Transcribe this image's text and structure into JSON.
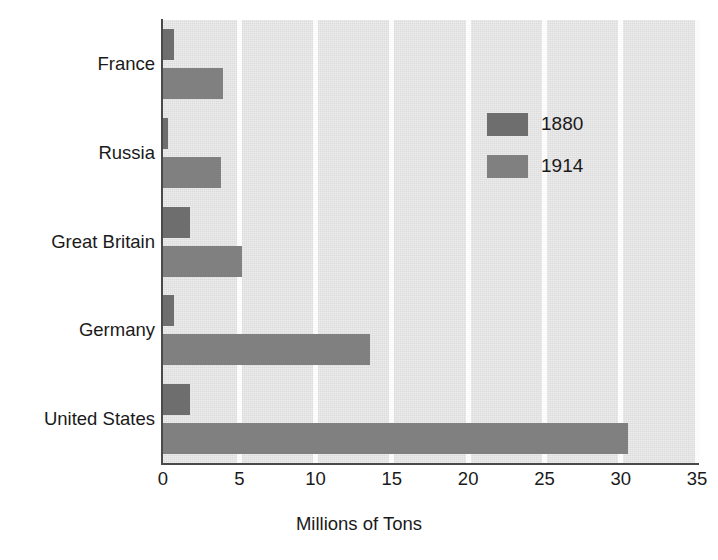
{
  "chart_data": {
    "type": "bar",
    "orientation": "horizontal",
    "title": "",
    "xlabel": "Millions of Tons",
    "ylabel": "",
    "xlim": [
      0,
      35
    ],
    "xticks": [
      "0",
      "5",
      "10",
      "15",
      "20",
      "25",
      "30",
      "35"
    ],
    "grid": "vertical-gridlines-at-xticks",
    "legend_position": "inside-upper-right",
    "categories": [
      "France",
      "Russia",
      "Great Britain",
      "Germany",
      "United States"
    ],
    "series": [
      {
        "name": "1880",
        "color": "#6e6e6e",
        "values": [
          0.7,
          0.3,
          1.8,
          0.7,
          1.8
        ]
      },
      {
        "name": "1914",
        "color": "#808080",
        "values": [
          3.9,
          3.8,
          5.2,
          13.6,
          30.5
        ]
      }
    ]
  },
  "axis": {
    "x_title": "Millions of Tons",
    "ticks": [
      {
        "label": "0",
        "value": 0
      },
      {
        "label": "5",
        "value": 5
      },
      {
        "label": "10",
        "value": 10
      },
      {
        "label": "15",
        "value": 15
      },
      {
        "label": "20",
        "value": 20
      },
      {
        "label": "25",
        "value": 25
      },
      {
        "label": "30",
        "value": 30
      },
      {
        "label": "35",
        "value": 35
      }
    ]
  },
  "legend": {
    "entries": [
      {
        "label": "1880",
        "color": "#6e6e6e"
      },
      {
        "label": "1914",
        "color": "#808080"
      }
    ]
  },
  "colors": {
    "plot_background": "#dcdcdc",
    "gridline": "#fbfbfb",
    "axis_line": "#4a4a4a",
    "series_1880": "#6e6e6e",
    "series_1914": "#808080",
    "text": "#1a1a1a",
    "page_background": "#ffffff"
  }
}
